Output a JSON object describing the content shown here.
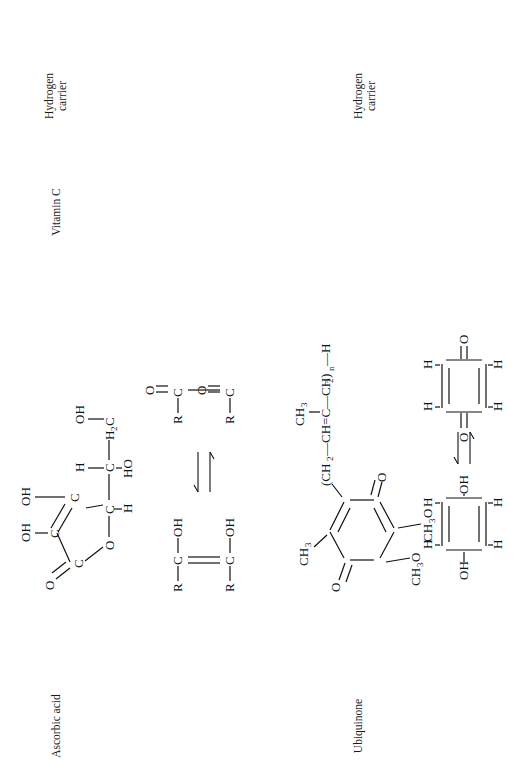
{
  "figure": {
    "orientation": "rotated-90-ccw",
    "background": "#ffffff",
    "ink": "#111111"
  },
  "columns": {
    "name_header": "",
    "role_header": "Hydrogen carrier",
    "alias_header": "Vitamin C"
  },
  "rows": [
    {
      "id": "ascorbic",
      "name": "Ascorbic acid",
      "alias": "Vitamin C",
      "role": "Hydrogen carrier",
      "structure_kind": "lactone-ring",
      "atoms": [
        "O",
        "C",
        "C",
        "C",
        "C",
        "OH",
        "OH",
        "H",
        "HO",
        "H",
        "H",
        "OH",
        "H",
        "C",
        "O"
      ],
      "labels": [
        "O",
        "OH",
        "OH",
        "H",
        "HO",
        "H",
        "OH",
        "H2C",
        "C",
        "O"
      ]
    },
    {
      "id": "generic-enediol",
      "name": "",
      "structure_kind": "equilibrium",
      "reduced_labels": [
        "R",
        "C",
        "OH",
        "R",
        "C",
        "OH"
      ],
      "oxidized_labels": [
        "R",
        "C",
        "O",
        "R",
        "C",
        "O"
      ],
      "arrow": "equilibrium"
    },
    {
      "id": "ubiquinone",
      "name": "Ubiquinone",
      "alias": "",
      "role": "Hydrogen carrier",
      "structure_kind": "benzoquinone",
      "ring_substituents": [
        "CH3",
        "CH3O",
        "CH3O",
        "O",
        "O"
      ],
      "side_chain": "(CH2—CH=C—CH2)n—H",
      "side_chain_parts": [
        "(CH",
        "2",
        "—CH=C—CH",
        "2",
        ")",
        "n",
        "—H"
      ],
      "side_chain_methyl": "CH3"
    },
    {
      "id": "quinone-quinol",
      "name": "",
      "structure_kind": "equilibrium",
      "reduced_labels": [
        "OH",
        "H",
        "H",
        "OH",
        "H",
        "H"
      ],
      "oxidized_labels": [
        "O",
        "H",
        "H",
        "O",
        "H",
        "H"
      ],
      "arrow": "equilibrium"
    }
  ],
  "text": {
    "ascorbic_acid": "Ascorbic acid",
    "ubiquinone": "Ubiquinone",
    "vitamin_c": "Vitamin C",
    "hydrogen_carrier_1_line1": "Hydrogen",
    "hydrogen_carrier_1_line2": "carrier",
    "hydrogen_carrier_2_line1": "Hydrogen",
    "hydrogen_carrier_2_line2": "carrier",
    "O": "O",
    "OH": "OH",
    "HO": "HO",
    "H": "H",
    "C": "C",
    "R": "R",
    "CH3": "CH",
    "three": "3",
    "two": "2",
    "n": "n",
    "H2C_main": "H",
    "H2C_sub": "2",
    "H2C_tail": "C",
    "CH3O_main": "CH",
    "CH3O_sub": "3",
    "CH3O_tail": "O",
    "chain_open": "(CH",
    "chain_mid": "—CH=C—CH",
    "chain_close": ")",
    "chain_end": "—H"
  }
}
